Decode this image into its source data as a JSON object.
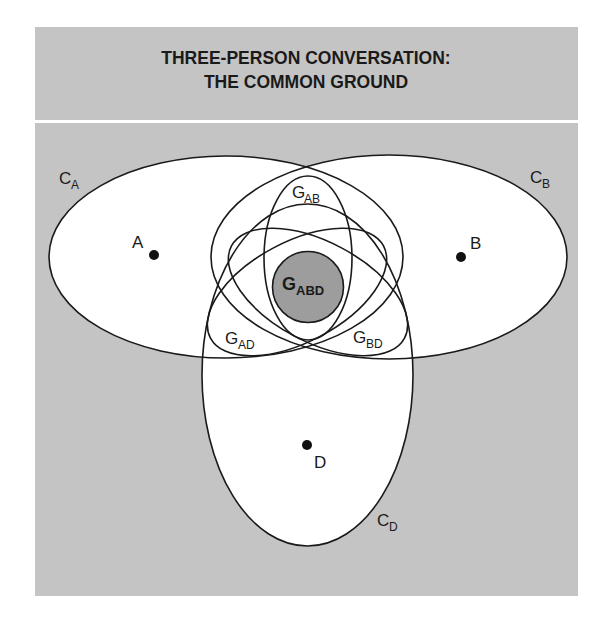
{
  "title": {
    "line1": "THREE-PERSON CONVERSATION:",
    "line2": "THE COMMON GROUND"
  },
  "colors": {
    "panel_gray": "#c4c4c4",
    "inner_white": "#ffffff",
    "core_gray": "#9d9d9d",
    "stroke": "#1a1a1a"
  },
  "people": [
    {
      "id": "A",
      "label": "A"
    },
    {
      "id": "B",
      "label": "B"
    },
    {
      "id": "D",
      "label": "D"
    }
  ],
  "contexts": [
    {
      "id": "CA",
      "main": "C",
      "sub": "A"
    },
    {
      "id": "CB",
      "main": "C",
      "sub": "B"
    },
    {
      "id": "CD",
      "main": "C",
      "sub": "D"
    }
  ],
  "grounds": [
    {
      "id": "GAB",
      "main": "G",
      "sub": "AB"
    },
    {
      "id": "GAD",
      "main": "G",
      "sub": "AD"
    },
    {
      "id": "GBD",
      "main": "G",
      "sub": "BD"
    },
    {
      "id": "GABD",
      "main": "G",
      "sub": "ABD"
    }
  ]
}
